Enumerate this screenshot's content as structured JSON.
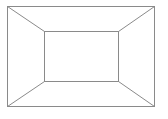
{
  "diagram": {
    "type": "perspective-frame",
    "stroke_color": "#8a8a8a",
    "background": "#ffffff",
    "stroke_width": 1,
    "outer_rect": {
      "x1": 7,
      "y1": 6,
      "x2": 154,
      "y2": 106
    },
    "inner_rect": {
      "x1": 44,
      "y1": 31,
      "x2": 118,
      "y2": 81
    },
    "connectors": [
      {
        "name": "top-left",
        "from": [
          7,
          6
        ],
        "to": [
          44,
          31
        ]
      },
      {
        "name": "top-right",
        "from": [
          154,
          6
        ],
        "to": [
          118,
          31
        ]
      },
      {
        "name": "bottom-left",
        "from": [
          7,
          106
        ],
        "to": [
          44,
          81
        ]
      },
      {
        "name": "bottom-right",
        "from": [
          154,
          106
        ],
        "to": [
          118,
          81
        ]
      }
    ]
  }
}
